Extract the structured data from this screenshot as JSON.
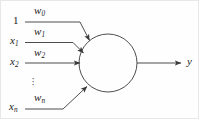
{
  "figure": {
    "stroke_color": "#3a3a3a",
    "text_color": "#1a1a1a",
    "background_color": "#fefefe"
  },
  "inputs": [
    {
      "id": "bias",
      "label": "1",
      "label_sub": "",
      "weight": "w",
      "weight_sub": "0"
    },
    {
      "id": "x1",
      "label": "x",
      "label_sub": "1",
      "weight": "w",
      "weight_sub": "1"
    },
    {
      "id": "x2",
      "label": "x",
      "label_sub": "2",
      "weight": "w",
      "weight_sub": "2"
    },
    {
      "id": "xn",
      "label": "x",
      "label_sub": "n",
      "weight": "w",
      "weight_sub": "n"
    }
  ],
  "ellipsis": {
    "glyph": "⋮",
    "dot": "·"
  },
  "output": {
    "label": "y",
    "label_sub": ""
  },
  "body": {
    "shape": "circle",
    "label": ""
  }
}
